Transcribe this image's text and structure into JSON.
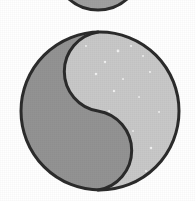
{
  "image": {
    "title": "Yin-yang style two-tone divided circle",
    "description": "A large circle outlined in dark gray, split by an S-shaped curve into a light gray region on the upper right and a medium gray region on the lower left, with a second partially visible circle cropped at the top edge of the frame.",
    "width": 195,
    "height": 201,
    "background_color": "#ffffff",
    "texture": "scanned halftone grain"
  },
  "palette": {
    "background": "#ffffff",
    "outline": "#2b2b2b",
    "light_region": "#c8c8c8",
    "dark_region": "#939393",
    "top_partial_fill": "#a0a0a0",
    "speckle": "#f2f2f2"
  },
  "shapes": [
    {
      "name": "top-partial-circle",
      "kind": "circle",
      "state": "cropped at top frame edge",
      "center_x": 98,
      "center_y": -34,
      "radius": 44,
      "visible_span_x": [
        57,
        140
      ],
      "visible_bottom_y": 8,
      "fill": "#a0a0a0",
      "stroke": "#2b2b2b",
      "stroke_width": 3
    },
    {
      "name": "main-circle",
      "kind": "circle",
      "center_x": 100,
      "center_y": 111,
      "radius": 79,
      "bounds": {
        "left": 21,
        "top": 32,
        "right": 179,
        "bottom": 190
      },
      "fill": "#c8c8c8",
      "stroke": "#2b2b2b",
      "stroke_width": 3
    },
    {
      "name": "s-curve-divider",
      "kind": "s-curve",
      "inflection_x": 98,
      "inflection_y": 107,
      "upper_lobe_side": "left",
      "lower_lobe_side": "right",
      "upper_lobe_radius": 40,
      "lower_lobe_radius": 40,
      "fill": "#939393",
      "stroke": "#2b2b2b",
      "stroke_width": 3
    }
  ],
  "speckles": [
    {
      "x": 118,
      "y": 51,
      "r": 1.4
    },
    {
      "x": 131,
      "y": 46,
      "r": 1.1
    },
    {
      "x": 105,
      "y": 62,
      "r": 1.2
    },
    {
      "x": 143,
      "y": 56,
      "r": 1.0
    },
    {
      "x": 96,
      "y": 74,
      "r": 1.3
    },
    {
      "x": 123,
      "y": 79,
      "r": 1.0
    },
    {
      "x": 150,
      "y": 72,
      "r": 1.1
    },
    {
      "x": 114,
      "y": 91,
      "r": 1.2
    },
    {
      "x": 139,
      "y": 97,
      "r": 0.9
    },
    {
      "x": 159,
      "y": 112,
      "r": 1.0
    },
    {
      "x": 151,
      "y": 148,
      "r": 1.3
    },
    {
      "x": 133,
      "y": 131,
      "r": 0.9
    },
    {
      "x": 146,
      "y": 171,
      "r": 1.0
    },
    {
      "x": 86,
      "y": 46,
      "r": 1.0
    },
    {
      "x": 109,
      "y": 111,
      "r": 1.1
    }
  ],
  "labels": {
    "figure_caption": "Two-tone S-divided circle"
  }
}
